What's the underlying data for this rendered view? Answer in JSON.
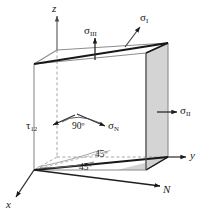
{
  "figure": {
    "type": "stress-cube-diagram",
    "background_color": "#ffffff",
    "line_color": "#1a1a1a",
    "edge_gray": "#8c8c8c",
    "face_shade": "#d4d4d4",
    "dashed_gray": "#9a9a9a"
  },
  "axes": [
    {
      "id": "z-axis",
      "label": "z",
      "direction": "up"
    },
    {
      "id": "y-axis",
      "label": "y",
      "direction": "right"
    },
    {
      "id": "x-axis",
      "label": "x",
      "direction": "down-left"
    }
  ],
  "stress_labels": [
    {
      "id": "sigma-1",
      "symbol": "σ",
      "subscript": "I",
      "full": "σI"
    },
    {
      "id": "sigma-2",
      "symbol": "σ",
      "subscript": "II",
      "full": "σII"
    },
    {
      "id": "sigma-3",
      "symbol": "σ",
      "subscript": "III",
      "full": "σIII"
    },
    {
      "id": "sigma-n",
      "symbol": "σ",
      "subscript": "N",
      "full": "σN"
    },
    {
      "id": "tau-12",
      "symbol": "τ",
      "subscript": "12",
      "full": "τ12"
    }
  ],
  "angles": [
    {
      "id": "angle-90",
      "value": "90",
      "unit": "º",
      "text": "90º"
    },
    {
      "id": "angle-45-upper",
      "value": "45",
      "unit": "º",
      "text": "45º"
    },
    {
      "id": "angle-45-lower",
      "value": "45",
      "unit": "º",
      "text": "45º"
    }
  ],
  "normal": {
    "id": "normal-direction",
    "label": "N"
  }
}
